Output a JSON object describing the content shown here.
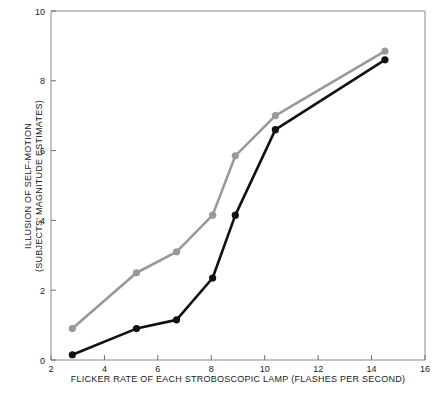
{
  "chart_data": {
    "type": "line",
    "title": "",
    "xlabel": "FLICKER RATE OF EACH STROBOSCOPIC LAMP (FLASHES PER SECOND)",
    "ylabel_line1": "ILLUSION OF SELF-MOTION",
    "ylabel_line2": "(SUBJECTS' MAGNITUDE ESTIMATES)",
    "xlim": [
      2,
      16
    ],
    "ylim": [
      0,
      10
    ],
    "xticks": [
      2,
      4,
      6,
      8,
      10,
      12,
      14,
      16
    ],
    "yticks": [
      0,
      2,
      4,
      6,
      8,
      10
    ],
    "xticklabels": [
      "2",
      "4",
      "6",
      "8",
      "10",
      "12",
      "14",
      "16"
    ],
    "yticklabels": [
      "0",
      "2",
      "4",
      "6",
      "8",
      "10"
    ],
    "grid": false,
    "legend": "none",
    "series": [
      {
        "name": "gray-series",
        "color": "#999999",
        "marker": "circle",
        "x": [
          2.8,
          5.2,
          6.7,
          8.05,
          8.9,
          10.4,
          14.5
        ],
        "y": [
          0.9,
          2.5,
          3.1,
          4.15,
          5.85,
          7.0,
          8.85
        ]
      },
      {
        "name": "black-series",
        "color": "#111111",
        "marker": "circle",
        "x": [
          2.8,
          5.2,
          6.7,
          8.05,
          8.9,
          10.4,
          14.5
        ],
        "y": [
          0.15,
          0.9,
          1.15,
          2.35,
          4.15,
          6.6,
          8.6
        ]
      }
    ]
  },
  "axes": {
    "frame_color": "#8a8a8a",
    "tick_color": "#6e6e6e",
    "text_color": "#1a1a1a"
  }
}
